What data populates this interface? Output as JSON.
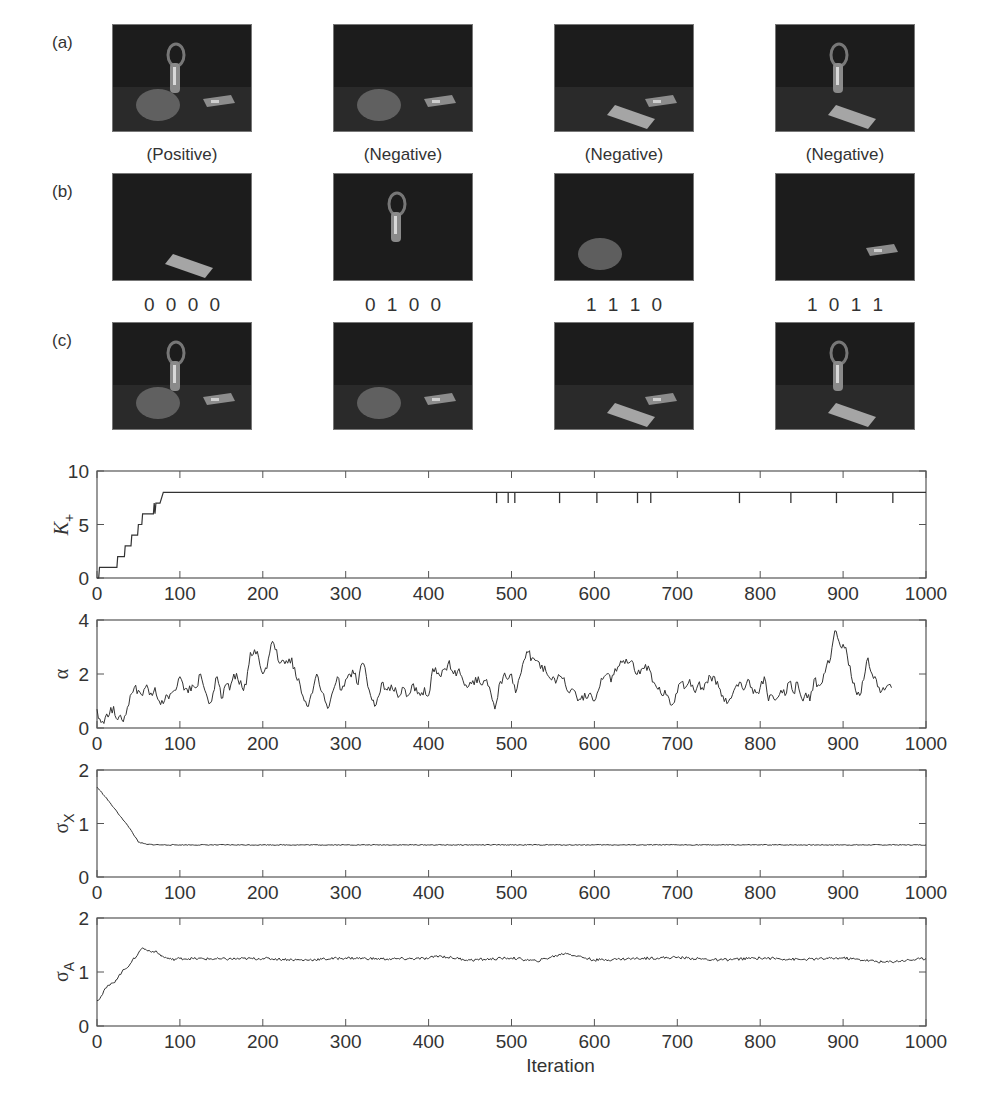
{
  "figure": {
    "row_labels": [
      "(a)",
      "(b)",
      "(c)"
    ],
    "row_a": {
      "captions": [
        "(Positive)",
        "(Negative)",
        "(Negative)",
        "(Negative)"
      ],
      "panels": [
        {
          "objects": [
            "pear",
            "bottle",
            "bar"
          ]
        },
        {
          "objects": [
            "pear",
            "bar"
          ]
        },
        {
          "objects": [
            "bar",
            "book"
          ]
        },
        {
          "objects": [
            "bottle",
            "book"
          ]
        }
      ]
    },
    "row_b": {
      "codes": [
        "0 0 0 0",
        "0 1 0 0",
        "1 1 1 0",
        "1 0 1 1"
      ],
      "panels": [
        {
          "objects": [
            "book"
          ]
        },
        {
          "objects": [
            "bottle"
          ]
        },
        {
          "objects": [
            "pear"
          ]
        },
        {
          "objects": [
            "bar"
          ]
        }
      ]
    },
    "row_c": {
      "panels": [
        {
          "objects": [
            "pear",
            "bottle",
            "bar"
          ]
        },
        {
          "objects": [
            "pear",
            "bar"
          ]
        },
        {
          "objects": [
            "bar",
            "book"
          ]
        },
        {
          "objects": [
            "bottle",
            "book"
          ]
        }
      ]
    }
  },
  "chart_data": [
    {
      "type": "line",
      "ylabel": "K+",
      "xlabel": "",
      "xlim": [
        0,
        1000
      ],
      "ylim": [
        0,
        10
      ],
      "xticks": [
        0,
        100,
        200,
        300,
        400,
        500,
        600,
        700,
        800,
        900,
        1000
      ],
      "yticks": [
        0,
        5,
        10
      ],
      "grid": false,
      "series": [
        {
          "name": "K+",
          "x": [
            0,
            2,
            3,
            24,
            25,
            33,
            34,
            41,
            42,
            49,
            50,
            54,
            55,
            68,
            69,
            70,
            71,
            75,
            76,
            80,
            1000
          ],
          "y": [
            0,
            0,
            1,
            1,
            2,
            2,
            3,
            3,
            4,
            4,
            5,
            5,
            6,
            6,
            7,
            6,
            7,
            7,
            7,
            8,
            8
          ]
        }
      ],
      "dips_to_7_at": [
        482,
        496,
        504,
        558,
        603,
        652,
        668,
        775,
        837,
        892,
        960
      ]
    },
    {
      "type": "line",
      "ylabel": "α",
      "xlabel": "",
      "xlim": [
        0,
        1000
      ],
      "ylim": [
        0,
        4
      ],
      "xticks": [
        0,
        100,
        200,
        300,
        400,
        500,
        600,
        700,
        800,
        900,
        1000
      ],
      "yticks": [
        0,
        2,
        4
      ],
      "grid": false,
      "series": [
        {
          "name": "alpha",
          "x": [
            0,
            5,
            10,
            15,
            20,
            25,
            30,
            35,
            40,
            45,
            50,
            55,
            60,
            65,
            70,
            75,
            80,
            85,
            90,
            95,
            100,
            105,
            110,
            115,
            120,
            125,
            130,
            135,
            140,
            145,
            150,
            155,
            160,
            165,
            170,
            175,
            180,
            185,
            190,
            195,
            200,
            205,
            210,
            215,
            220,
            225,
            230,
            235,
            240,
            245,
            250,
            255,
            260,
            265,
            270,
            275,
            280,
            285,
            290,
            295,
            300,
            305,
            310,
            315,
            320,
            325,
            330,
            335,
            340,
            345,
            350,
            355,
            360,
            365,
            370,
            375,
            380,
            385,
            390,
            395,
            400,
            405,
            410,
            415,
            420,
            425,
            430,
            435,
            440,
            445,
            450,
            455,
            460,
            465,
            470,
            475,
            480,
            485,
            490,
            495,
            500,
            505,
            510,
            515,
            520,
            525,
            530,
            535,
            540,
            545,
            550,
            555,
            560,
            565,
            570,
            575,
            580,
            585,
            590,
            595,
            600,
            605,
            610,
            615,
            620,
            625,
            630,
            635,
            640,
            645,
            650,
            655,
            660,
            665,
            670,
            675,
            680,
            685,
            690,
            695,
            700,
            705,
            710,
            715,
            720,
            725,
            730,
            735,
            740,
            745,
            750,
            755,
            760,
            765,
            770,
            775,
            780,
            785,
            790,
            795,
            800,
            805,
            810,
            815,
            820,
            825,
            830,
            835,
            840,
            845,
            850,
            855,
            860,
            865,
            870,
            875,
            880,
            885,
            890,
            895,
            900,
            905,
            910,
            915,
            920,
            925,
            930,
            935,
            940,
            945,
            950,
            955,
            960,
            965,
            970,
            975,
            980,
            985,
            990,
            995,
            1000
          ],
          "y": [
            0.7,
            0.2,
            0.4,
            0.5,
            0.8,
            0.3,
            0.3,
            0.5,
            1.2,
            1.5,
            1.4,
            1.2,
            1.6,
            1.3,
            1.5,
            1.0,
            0.9,
            1.2,
            1.3,
            1.4,
            1.9,
            1.4,
            1.3,
            1.6,
            1.5,
            2.0,
            1.4,
            0.9,
            1.3,
            1.9,
            1.1,
            1.6,
            1.4,
            2.0,
            1.8,
            1.5,
            1.6,
            2.8,
            2.9,
            2.6,
            2.0,
            2.2,
            3.1,
            2.9,
            2.4,
            2.5,
            2.4,
            2.6,
            1.9,
            1.6,
            1.0,
            0.8,
            1.3,
            2.0,
            1.4,
            1.0,
            0.8,
            1.4,
            1.9,
            1.4,
            1.8,
            2.0,
            2.0,
            1.6,
            2.4,
            1.9,
            1.2,
            0.8,
            1.2,
            1.7,
            1.4,
            1.6,
            1.5,
            1.2,
            1.5,
            1.2,
            1.6,
            1.5,
            1.2,
            1.5,
            1.2,
            2.2,
            2.0,
            1.9,
            2.2,
            2.5,
            2.0,
            2.1,
            1.9,
            1.6,
            1.7,
            1.6,
            1.9,
            1.6,
            1.8,
            1.3,
            0.7,
            1.6,
            1.9,
            1.8,
            2.0,
            1.3,
            1.9,
            2.5,
            2.8,
            2.6,
            2.5,
            2.2,
            2.3,
            1.9,
            1.9,
            1.8,
            1.9,
            1.6,
            1.3,
            1.4,
            1.0,
            1.2,
            1.1,
            1.3,
            1.0,
            1.4,
            1.8,
            2.0,
            1.7,
            2.2,
            2.3,
            2.5,
            2.4,
            2.5,
            2.0,
            2.0,
            2.2,
            2.3,
            1.7,
            1.5,
            1.3,
            1.4,
            1.1,
            0.9,
            1.3,
            1.7,
            1.5,
            1.8,
            1.4,
            1.6,
            1.5,
            1.7,
            1.9,
            1.9,
            1.5,
            1.2,
            0.9,
            1.1,
            1.5,
            1.7,
            1.4,
            1.8,
            1.5,
            1.3,
            1.5,
            1.9,
            1.0,
            1.2,
            1.1,
            1.4,
            1.2,
            1.7,
            1.3,
            1.7,
            1.1,
            1.3,
            1.0,
            1.8,
            1.6,
            1.7,
            2.3,
            2.6,
            3.6,
            3.2,
            3.1,
            2.7,
            1.9,
            1.4,
            1.2,
            1.8,
            2.6,
            2.0,
            1.8,
            1.3,
            1.4,
            1.6,
            1.5
          ],
          "note": "approximate trace; noisy MCMC sample of alpha"
        }
      ]
    },
    {
      "type": "line",
      "ylabel": "σX",
      "xlabel": "",
      "xlim": [
        0,
        1000
      ],
      "ylim": [
        0,
        2
      ],
      "xticks": [
        0,
        100,
        200,
        300,
        400,
        500,
        600,
        700,
        800,
        900,
        1000
      ],
      "yticks": [
        0,
        1,
        2
      ],
      "grid": false,
      "series": [
        {
          "name": "sigma_X",
          "x": [
            0,
            10,
            20,
            30,
            40,
            50,
            60,
            80,
            100,
            200,
            300,
            400,
            500,
            600,
            700,
            800,
            900,
            1000
          ],
          "y": [
            1.68,
            1.5,
            1.3,
            1.1,
            0.9,
            0.65,
            0.61,
            0.6,
            0.6,
            0.6,
            0.6,
            0.6,
            0.6,
            0.6,
            0.6,
            0.6,
            0.6,
            0.6
          ]
        }
      ]
    },
    {
      "type": "line",
      "ylabel": "σA",
      "xlabel": "Iteration",
      "xlim": [
        0,
        1000
      ],
      "ylim": [
        0,
        2
      ],
      "xticks": [
        0,
        100,
        200,
        300,
        400,
        500,
        600,
        700,
        800,
        900,
        1000
      ],
      "yticks": [
        0,
        1,
        2
      ],
      "grid": false,
      "series": [
        {
          "name": "sigma_A",
          "x": [
            0,
            5,
            10,
            20,
            30,
            40,
            50,
            55,
            60,
            70,
            80,
            90,
            100,
            150,
            200,
            250,
            300,
            350,
            400,
            410,
            450,
            500,
            530,
            565,
            600,
            650,
            700,
            750,
            800,
            850,
            900,
            950,
            1000
          ],
          "y": [
            0.47,
            0.55,
            0.7,
            0.8,
            1.0,
            1.15,
            1.35,
            1.45,
            1.4,
            1.38,
            1.28,
            1.23,
            1.25,
            1.24,
            1.25,
            1.22,
            1.26,
            1.24,
            1.25,
            1.3,
            1.22,
            1.26,
            1.2,
            1.35,
            1.22,
            1.25,
            1.27,
            1.22,
            1.26,
            1.23,
            1.26,
            1.18,
            1.25
          ]
        }
      ]
    }
  ],
  "axes_text": {
    "ylabels": [
      "K+",
      "α",
      "σX",
      "σA"
    ],
    "xlabel": "Iteration"
  }
}
